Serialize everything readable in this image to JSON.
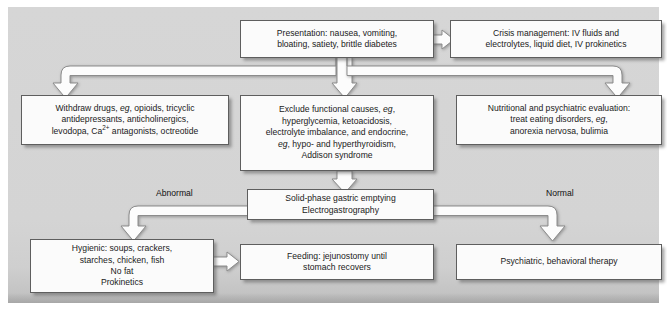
{
  "figure": {
    "background_color": "#d5d5d5",
    "box_fill_color": "#fbfbfb",
    "box_border_color": "#5e5e5e",
    "connector_fill_color": "#fcfcfc",
    "connector_outline_color": "#8c8c8c"
  },
  "nodes": {
    "presentation": {
      "id": "presentation",
      "lines": [
        "Presentation: nausea, vomiting,",
        "bloating, satiety, brittle diabetes"
      ]
    },
    "crisis": {
      "id": "crisis",
      "lines": [
        "Crisis management: IV fluids and",
        "electrolytes, liquid diet, IV prokinetics"
      ]
    },
    "withdraw": {
      "id": "withdraw",
      "lines": [
        "Withdraw drugs, eg, opioids, tricyclic",
        "antidepressants, anticholinergics,",
        "levodopa, Ca2+ antagonists, octreotide"
      ]
    },
    "exclude": {
      "id": "exclude",
      "lines": [
        "Exclude functional causes, eg,",
        "hyperglycemia, ketoacidosis,",
        "electrolyte imbalance, and endocrine,",
        "eg, hypo- and hyperthyroidism,",
        "Addison syndrome"
      ]
    },
    "nutritional": {
      "id": "nutritional",
      "lines": [
        "Nutritional and psychiatric evaluation:",
        "treat eating disorders, eg,",
        "anorexia nervosa, bulimia"
      ]
    },
    "test": {
      "id": "test",
      "lines": [
        "Solid-phase gastric emptying",
        "Electrogastrography"
      ]
    },
    "hygienic": {
      "id": "hygienic",
      "lines": [
        "Hygienic: soups, crackers,",
        "starches, chicken, fish",
        "No fat",
        "Prokinetics"
      ]
    },
    "feeding": {
      "id": "feeding",
      "lines": [
        "Feeding: jejunostomy until",
        "stomach recovers"
      ]
    },
    "psychiatric": {
      "id": "psychiatric",
      "lines": [
        "Psychiatric, behavioral therapy"
      ]
    }
  },
  "branch_labels": {
    "abnormal": "Abnormal",
    "normal": "Normal"
  },
  "edges": [
    {
      "from": "presentation",
      "to": "crisis",
      "direction": "right"
    },
    {
      "from": "presentation",
      "to": "withdraw",
      "direction": "down-left"
    },
    {
      "from": "presentation",
      "to": "exclude",
      "direction": "down"
    },
    {
      "from": "presentation",
      "to": "nutritional",
      "direction": "down-right"
    },
    {
      "from": "exclude",
      "to": "test",
      "direction": "down"
    },
    {
      "from": "test",
      "to": "hygienic",
      "direction": "down-left",
      "label": "Abnormal"
    },
    {
      "from": "test",
      "to": "psychiatric",
      "direction": "down-right",
      "label": "Normal"
    },
    {
      "from": "hygienic",
      "to": "feeding",
      "direction": "right"
    }
  ]
}
